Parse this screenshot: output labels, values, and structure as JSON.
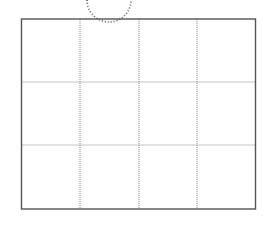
{
  "diagram": {
    "type": "grid",
    "rows": 3,
    "columns": 4,
    "frame": {
      "x": 21.5,
      "y": 19,
      "width": 234,
      "height": 190
    },
    "column_dividers_x": [
      80,
      139,
      197
    ],
    "row_dividers_y": [
      82,
      145
    ],
    "arc": {
      "cx": 109,
      "cy": -2,
      "r": 22
    },
    "colors": {
      "frame": "#555555",
      "grid": "#888888",
      "arc": "#555555"
    }
  }
}
